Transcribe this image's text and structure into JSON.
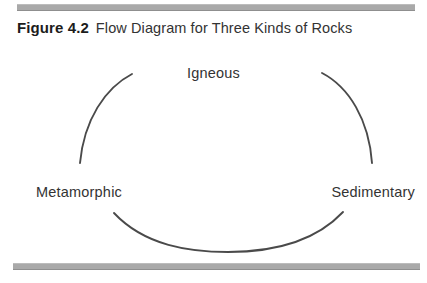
{
  "figure": {
    "number": "Figure 4.2",
    "caption": "Flow Diagram for Three Kinds of Rocks"
  },
  "diagram": {
    "type": "cycle",
    "nodes": [
      {
        "id": "igneous",
        "label": "Igneous",
        "position": "top"
      },
      {
        "id": "metamorphic",
        "label": "Metamorphic",
        "position": "bottom-left"
      },
      {
        "id": "sedimentary",
        "label": "Sedimentary",
        "position": "bottom-right"
      }
    ],
    "arcs": [
      {
        "id": "arc-igneous-to-metamorphic",
        "from": "igneous",
        "to": "metamorphic"
      },
      {
        "id": "arc-igneous-to-sedimentary",
        "from": "igneous",
        "to": "sedimentary"
      },
      {
        "id": "arc-metamorphic-to-sedimentary",
        "from": "metamorphic",
        "to": "sedimentary"
      }
    ]
  },
  "colors": {
    "rule": "#a9a9a9",
    "arc": "#4a4a4a",
    "caption_number": "#1c1c1c",
    "caption_text": "#333333",
    "label": "#333333",
    "background": "#ffffff"
  }
}
